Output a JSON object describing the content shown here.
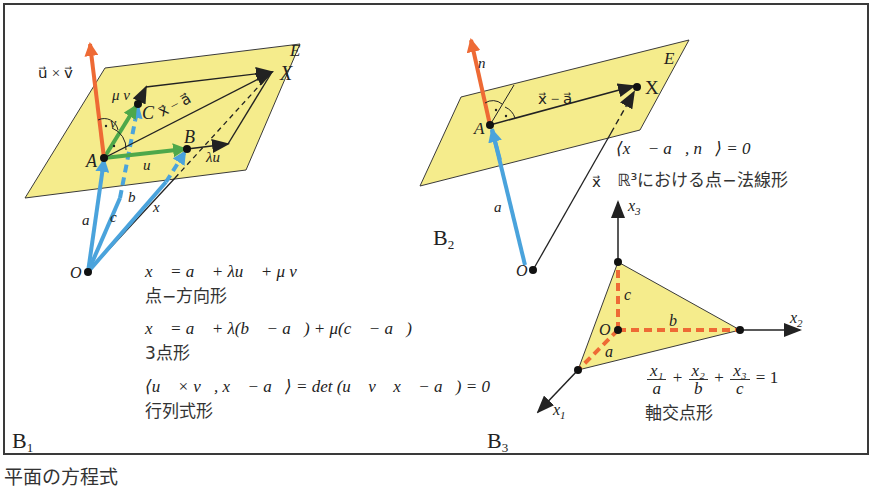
{
  "caption": "平面の方程式",
  "colors": {
    "plane_fill": "#f5ec8c",
    "plane_edge": "#3a3a3a",
    "normal_orange": "#ee6a35",
    "position_blue": "#4aa3dc",
    "direction_green": "#4ea84a",
    "intercept_dashed": "#ee6a35",
    "frame": "#3a3a3a"
  },
  "panels": [
    {
      "id": "B1",
      "label": "B",
      "sub": "1",
      "plane_label": "E",
      "points": {
        "O": "O",
        "A": "A",
        "B": "B",
        "C": "C",
        "X": "X"
      },
      "vector_labels": {
        "normal": "u⃗ × v⃗",
        "mu_v": "μ v⃗",
        "v": "v⃗",
        "u": "u⃗",
        "lambda_u": "λu⃗",
        "x_minus_a": "x⃗ − a⃗",
        "a": "a⃗",
        "b": "b⃗",
        "c": "c⃗",
        "x": "x⃗"
      },
      "equations": [
        {
          "formula": "x⃗ = a⃗ + λu⃗ + μ v⃗",
          "name": "点−方向形"
        },
        {
          "formula": "x⃗ = a⃗ + λ(b⃗ − a⃗) + μ(c⃗ − a⃗)",
          "name": "3点形"
        },
        {
          "formula": "⟨u⃗ × v⃗, x⃗ − a⃗⟩ = det (u⃗ v⃗ x⃗ − a⃗) = 0",
          "name": "行列式形"
        }
      ]
    },
    {
      "id": "B2",
      "label": "B",
      "sub": "2",
      "plane_label": "E",
      "points": {
        "O": "O",
        "A": "A",
        "X": "X"
      },
      "vector_labels": {
        "normal": "n⃗",
        "x_minus_a": "x⃗ − a⃗",
        "a": "a⃗",
        "x": "x⃗"
      },
      "equations": [
        {
          "formula": "⟨x⃗ − a⃗, n⃗⟩ = 0",
          "name": "ℝ³における点−法線形"
        }
      ]
    },
    {
      "id": "B3",
      "label": "B",
      "sub": "3",
      "points": {
        "O": "O"
      },
      "axes": {
        "x1": "x",
        "x1_sub": "1",
        "x2": "x",
        "x2_sub": "2",
        "x3": "x",
        "x3_sub": "3"
      },
      "intercepts": {
        "a": "a",
        "b": "b",
        "c": "c"
      },
      "equations": [
        {
          "formula": "x₁/a + x₂/b + x₃/c = 1",
          "terms": [
            {
              "num": "x₁",
              "den": "a"
            },
            {
              "num": "x₂",
              "den": "b"
            },
            {
              "num": "x₃",
              "den": "c"
            }
          ],
          "plus": "+",
          "rhs": "= 1",
          "name": "軸交点形"
        }
      ]
    }
  ]
}
